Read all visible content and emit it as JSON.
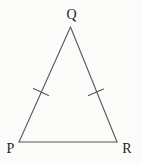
{
  "figure": {
    "width": 142,
    "height": 164,
    "colors": {
      "background": "#fbfbf9",
      "stroke": "#585858",
      "label": "#1e1e1e"
    },
    "vertices": {
      "Q": {
        "x": 70.5,
        "y": 27,
        "label": "Q",
        "label_x": 71.5,
        "label_y": 19
      },
      "P": {
        "x": 19,
        "y": 142,
        "label": "P",
        "label_x": 10.5,
        "label_y": 153
      },
      "R": {
        "x": 117,
        "y": 142,
        "label": "R",
        "label_x": 127,
        "label_y": 153
      }
    },
    "ticks": {
      "pq": {
        "x1": 33.5,
        "y1": 88.5,
        "x2": 48.5,
        "y2": 95.5
      },
      "qr": {
        "x1": 88.5,
        "y1": 95.5,
        "x2": 103.5,
        "y2": 89
      }
    }
  }
}
